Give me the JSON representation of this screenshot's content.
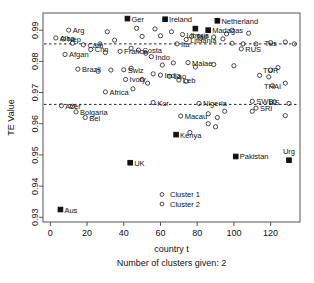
{
  "chart_data": {
    "type": "scatter",
    "title": "",
    "xlabel": "country t",
    "ylabel": "TE Value",
    "subtitle": "Number of clusters given: 2",
    "xlim": [
      -4,
      136
    ],
    "ylim": [
      0.9285,
      0.9955
    ],
    "xticks": [
      0,
      20,
      40,
      60,
      80,
      100,
      120
    ],
    "xticklabels": [
      "0",
      "20",
      "40",
      "60",
      "80",
      "100",
      "120"
    ],
    "yticks": [
      0.93,
      0.94,
      0.95,
      0.96,
      0.97,
      0.98,
      0.99
    ],
    "yticklabels": [
      "0.93",
      "0.94",
      "0.95",
      "0.96",
      "0.97",
      "0.98",
      "0.99"
    ],
    "grid": false,
    "reference_lines": [
      {
        "type": "horizontal",
        "y": 0.9856,
        "style": "dashed"
      },
      {
        "type": "horizontal",
        "y": 0.9662,
        "style": "dashed"
      }
    ],
    "legend": {
      "position": "bottom-center",
      "entries": [
        {
          "label": "Cluster 1",
          "marker": "filled-square"
        },
        {
          "label": "Cluster 2",
          "marker": "open-circle"
        }
      ]
    },
    "series": [
      {
        "name": "Cluster 1",
        "marker": "filled-square",
        "color": "#111111",
        "points": [
          {
            "x": 5.5,
            "y": 0.9325,
            "label": "Aus"
          },
          {
            "x": 43.5,
            "y": 0.9475,
            "label": "UK"
          },
          {
            "x": 68.5,
            "y": 0.9565,
            "label": "Kenya"
          },
          {
            "x": 101,
            "y": 0.9495,
            "label": "Pakistan"
          },
          {
            "x": 130,
            "y": 0.9483,
            "label": "Urg"
          },
          {
            "x": 62.5,
            "y": 0.9935,
            "label": "Ireland"
          },
          {
            "x": 91,
            "y": 0.993,
            "label": "Netherland"
          },
          {
            "x": 79,
            "y": 0.9905,
            "label": ""
          },
          {
            "x": 86,
            "y": 0.99,
            "label": "Madagas"
          },
          {
            "x": 42,
            "y": 0.9937,
            "label": "Ger"
          }
        ]
      },
      {
        "name": "Cluster 2",
        "marker": "open-circle",
        "color": "#333333",
        "points": [
          {
            "x": 10,
            "y": 0.99,
            "label": "Arg"
          },
          {
            "x": 3,
            "y": 0.9875,
            "label": "Alba"
          },
          {
            "x": 7,
            "y": 0.9872,
            "label": "Nep"
          },
          {
            "x": 12,
            "y": 0.9858,
            "label": ""
          },
          {
            "x": 18,
            "y": 0.9853,
            "label": "Cam"
          },
          {
            "x": 22,
            "y": 0.9838,
            "label": "Chn"
          },
          {
            "x": 8,
            "y": 0.9822,
            "label": "Afgan"
          },
          {
            "x": 30,
            "y": 0.9828,
            "label": ""
          },
          {
            "x": 38,
            "y": 0.9832,
            "label": "France"
          },
          {
            "x": 48,
            "y": 0.9836,
            "label": "Costa"
          },
          {
            "x": 44,
            "y": 0.9842,
            "label": ""
          },
          {
            "x": 52,
            "y": 0.9826,
            "label": ""
          },
          {
            "x": 15,
            "y": 0.9775,
            "label": "Brazil"
          },
          {
            "x": 26,
            "y": 0.9768,
            "label": ""
          },
          {
            "x": 33,
            "y": 0.9772,
            "label": ""
          },
          {
            "x": 40,
            "y": 0.9773,
            "label": "Swiz"
          },
          {
            "x": 44,
            "y": 0.9778,
            "label": ""
          },
          {
            "x": 41,
            "y": 0.9742,
            "label": "Ivory"
          },
          {
            "x": 30,
            "y": 0.9702,
            "label": "Africa"
          },
          {
            "x": 45,
            "y": 0.9712,
            "label": ""
          },
          {
            "x": 6,
            "y": 0.9658,
            "label": "Azer"
          },
          {
            "x": 12,
            "y": 0.9656,
            "label": ""
          },
          {
            "x": 14,
            "y": 0.9638,
            "label": "Bolgaria"
          },
          {
            "x": 19,
            "y": 0.962,
            "label": "Bel"
          },
          {
            "x": 55,
            "y": 0.9815,
            "label": "Indo"
          },
          {
            "x": 60,
            "y": 0.9882,
            "label": ""
          },
          {
            "x": 66,
            "y": 0.9895,
            "label": ""
          },
          {
            "x": 72,
            "y": 0.9886,
            "label": "Liberia"
          },
          {
            "x": 77,
            "y": 0.988,
            "label": "Tad"
          },
          {
            "x": 74,
            "y": 0.987,
            "label": "Lituania"
          },
          {
            "x": 82,
            "y": 0.9874,
            "label": ""
          },
          {
            "x": 89,
            "y": 0.9878,
            "label": ""
          },
          {
            "x": 94,
            "y": 0.9872,
            "label": ""
          },
          {
            "x": 69,
            "y": 0.9856,
            "label": "Ita"
          },
          {
            "x": 99,
            "y": 0.9858,
            "label": ""
          },
          {
            "x": 105,
            "y": 0.9856,
            "label": ""
          },
          {
            "x": 112,
            "y": 0.9856,
            "label": ""
          },
          {
            "x": 120,
            "y": 0.986,
            "label": "Tus"
          },
          {
            "x": 128,
            "y": 0.9862,
            "label": ""
          },
          {
            "x": 133,
            "y": 0.9856,
            "label": ""
          },
          {
            "x": 104,
            "y": 0.984,
            "label": "RUS"
          },
          {
            "x": 61,
            "y": 0.9788,
            "label": ""
          },
          {
            "x": 67,
            "y": 0.9795,
            "label": ""
          },
          {
            "x": 75,
            "y": 0.9796,
            "label": "Malae"
          },
          {
            "x": 79,
            "y": 0.9782,
            "label": ""
          },
          {
            "x": 89,
            "y": 0.979,
            "label": ""
          },
          {
            "x": 100,
            "y": 0.9786,
            "label": ""
          },
          {
            "x": 120,
            "y": 0.9772,
            "label": "TUR"
          },
          {
            "x": 124,
            "y": 0.978,
            "label": ""
          },
          {
            "x": 114,
            "y": 0.9755,
            "label": ""
          },
          {
            "x": 119,
            "y": 0.975,
            "label": ""
          },
          {
            "x": 56,
            "y": 0.976,
            "label": ""
          },
          {
            "x": 60,
            "y": 0.9756,
            "label": "India"
          },
          {
            "x": 65,
            "y": 0.9752,
            "label": "Lao"
          },
          {
            "x": 70,
            "y": 0.974,
            "label": "Leb"
          },
          {
            "x": 74,
            "y": 0.9736,
            "label": ""
          },
          {
            "x": 50,
            "y": 0.9742,
            "label": ""
          },
          {
            "x": 53,
            "y": 0.973,
            "label": ""
          },
          {
            "x": 121,
            "y": 0.9722,
            "label": "THAI"
          },
          {
            "x": 128,
            "y": 0.973,
            "label": ""
          },
          {
            "x": 56,
            "y": 0.9668,
            "label": "Kor"
          },
          {
            "x": 81,
            "y": 0.9665,
            "label": "Nigeria"
          },
          {
            "x": 110,
            "y": 0.9672,
            "label": "SWB"
          },
          {
            "x": 122,
            "y": 0.967,
            "label": "US"
          },
          {
            "x": 130,
            "y": 0.9665,
            "label": ""
          },
          {
            "x": 112,
            "y": 0.965,
            "label": "SRI"
          },
          {
            "x": 110,
            "y": 0.964,
            "label": ""
          },
          {
            "x": 71,
            "y": 0.9625,
            "label": "Macau"
          },
          {
            "x": 86,
            "y": 0.9632,
            "label": ""
          },
          {
            "x": 91,
            "y": 0.962,
            "label": ""
          },
          {
            "x": 95,
            "y": 0.964,
            "label": ""
          },
          {
            "x": 128,
            "y": 0.9626,
            "label": ""
          },
          {
            "x": 76,
            "y": 0.9572,
            "label": ""
          },
          {
            "x": 86,
            "y": 0.96,
            "label": ""
          },
          {
            "x": 90,
            "y": 0.959,
            "label": ""
          },
          {
            "x": 35,
            "y": 0.9868,
            "label": ""
          },
          {
            "x": 27,
            "y": 0.9856,
            "label": ""
          },
          {
            "x": 50,
            "y": 0.988,
            "label": ""
          },
          {
            "x": 57,
            "y": 0.9904,
            "label": ""
          },
          {
            "x": 47,
            "y": 0.9906,
            "label": ""
          },
          {
            "x": 99,
            "y": 0.99,
            "label": ""
          },
          {
            "x": 96,
            "y": 0.9888,
            "label": ""
          },
          {
            "x": 108,
            "y": 0.989,
            "label": ""
          },
          {
            "x": 31,
            "y": 0.9895,
            "label": ""
          }
        ]
      }
    ]
  },
  "axis": {
    "y_title": "TE Value",
    "x_title": "country t",
    "sub_title": "Number of clusters given: 2"
  }
}
